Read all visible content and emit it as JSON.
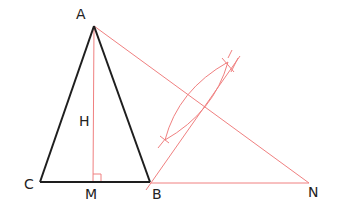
{
  "diagram": {
    "type": "geometric-construction",
    "colors": {
      "black_stroke": "#1e1e1e",
      "red_stroke": "#f08080",
      "background": "#ffffff"
    },
    "points": {
      "A": {
        "label": "A",
        "x": 94,
        "y": 26,
        "label_x": 76,
        "label_y": 19
      },
      "B": {
        "label": "B",
        "x": 150,
        "y": 182,
        "label_x": 152,
        "label_y": 199
      },
      "C": {
        "label": "C",
        "x": 40,
        "y": 182,
        "label_x": 24,
        "label_y": 189
      },
      "M": {
        "label": "M",
        "x": 93,
        "y": 182,
        "label_x": 85,
        "label_y": 199
      },
      "N": {
        "label": "N",
        "x": 309,
        "y": 183,
        "label_x": 308,
        "label_y": 197
      },
      "H": {
        "label": "H",
        "x": 85,
        "y": 120,
        "label_x": 79,
        "label_y": 126
      }
    },
    "segments": {
      "black": [
        [
          "A",
          "C"
        ],
        [
          "A",
          "B"
        ],
        [
          "C",
          "B"
        ]
      ],
      "red": [
        [
          "A",
          "M"
        ],
        [
          "A",
          "N"
        ],
        [
          "B",
          "N"
        ],
        [
          "B",
          "bisector_top"
        ]
      ]
    },
    "right_angle_at": "M",
    "construction": {
      "bisector_line": {
        "x1": 150,
        "y1": 184,
        "x2": 240,
        "y2": 56
      },
      "arc_lens": {
        "x1": 165,
        "y1": 140,
        "x2": 228,
        "y2": 62
      }
    }
  }
}
